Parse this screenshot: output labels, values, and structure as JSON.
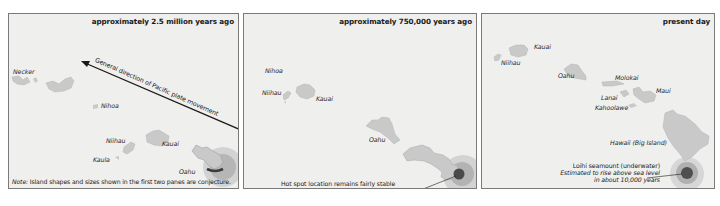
{
  "panels": [
    {
      "title": "approximately 2.5 million years ago",
      "arrow_label": "General direction of Pacific plate movement",
      "islands": [
        {
          "name": "Necker"
        },
        {
          "name": "Nihoa"
        },
        {
          "name": "Niihau"
        },
        {
          "name": "Kauai"
        },
        {
          "name": "Kaula"
        },
        {
          "name": "Oahu"
        }
      ],
      "note_label": "Note:",
      "note_text": " Island shapes and sizes shown in the first two panes are conjecture."
    },
    {
      "title": "approximately 750,000 years ago",
      "islands": [
        {
          "name": "Nihoa"
        },
        {
          "name": "Niihau"
        },
        {
          "name": "Kauai"
        },
        {
          "name": "Oahu"
        }
      ],
      "callout": "Hot spot location remains fairly stable"
    },
    {
      "title": "present day",
      "islands": [
        {
          "name": "Kauai"
        },
        {
          "name": "Niihau"
        },
        {
          "name": "Oahu"
        },
        {
          "name": "Molokai"
        },
        {
          "name": "Maui"
        },
        {
          "name": "Lanai"
        },
        {
          "name": "Kahoolawe"
        },
        {
          "name": "Hawaii (Big Island)"
        }
      ],
      "callout_line1": "Loihi seamount (underwater)",
      "callout_line2": "Estimated to rise above sea level",
      "callout_line3": "in about 10,000 years"
    }
  ],
  "colors": {
    "panel_bg": "#efefee",
    "island_fill": "#c9c9c9",
    "hotspot_outer": "#cfcfcf",
    "hotspot_mid": "#a9a9a9",
    "hotspot_core": "#4a4a4a"
  }
}
